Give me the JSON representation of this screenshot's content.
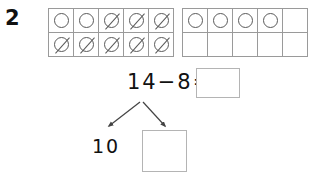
{
  "question": {
    "number": "2"
  },
  "frames": [
    {
      "name": "minuend-ten-frame",
      "rows": [
        [
          "circle",
          "circle",
          "circle-crossed",
          "circle-crossed",
          "circle-crossed"
        ],
        [
          "circle-crossed",
          "circle-crossed",
          "circle-crossed",
          "circle-crossed",
          "circle-crossed"
        ]
      ]
    },
    {
      "name": "remainder-ten-frame",
      "rows": [
        [
          "circle",
          "circle",
          "circle",
          "circle",
          "empty"
        ],
        [
          "empty",
          "empty",
          "empty",
          "empty",
          "empty"
        ]
      ]
    }
  ],
  "equation": {
    "text": "14−8=",
    "minuend": "14",
    "operator": "−",
    "subtrahend": "8",
    "equals": "=",
    "answer_value": ""
  },
  "decomposition": {
    "left_part": "10",
    "right_part": ""
  },
  "colors": {
    "background": "#ffffff",
    "text": "#111111",
    "grid_line": "#9a9a9a",
    "counter_outline": "#5a5a5a",
    "box_border": "#b4b4b4",
    "arrow": "#444444"
  }
}
